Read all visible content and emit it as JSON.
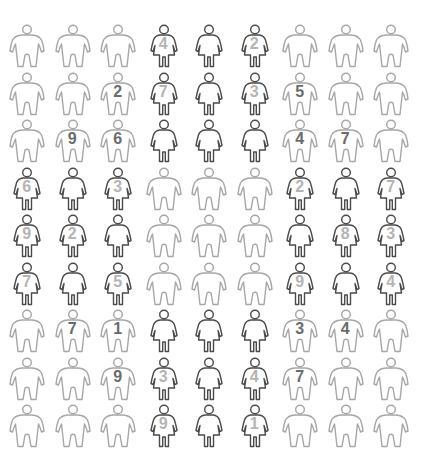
{
  "figure_grid": {
    "rows": 9,
    "columns": 9,
    "colors": {
      "male_outline": "#a6a6a6",
      "female_outline": "#4a4a4a",
      "male_number": "#6b6b6b",
      "female_number": "#b4b4b4",
      "background": "#ffffff"
    },
    "cells": [
      [
        {
          "type": "male",
          "num": ""
        },
        {
          "type": "male",
          "num": ""
        },
        {
          "type": "male",
          "num": ""
        },
        {
          "type": "female",
          "num": "4"
        },
        {
          "type": "female",
          "num": ""
        },
        {
          "type": "female",
          "num": "2"
        },
        {
          "type": "male",
          "num": ""
        },
        {
          "type": "male",
          "num": ""
        },
        {
          "type": "male",
          "num": ""
        }
      ],
      [
        {
          "type": "male",
          "num": ""
        },
        {
          "type": "male",
          "num": ""
        },
        {
          "type": "male",
          "num": "2"
        },
        {
          "type": "female",
          "num": "7"
        },
        {
          "type": "female",
          "num": ""
        },
        {
          "type": "female",
          "num": "3"
        },
        {
          "type": "male",
          "num": "5"
        },
        {
          "type": "male",
          "num": ""
        },
        {
          "type": "male",
          "num": ""
        }
      ],
      [
        {
          "type": "male",
          "num": ""
        },
        {
          "type": "male",
          "num": "9"
        },
        {
          "type": "male",
          "num": "6"
        },
        {
          "type": "female",
          "num": ""
        },
        {
          "type": "female",
          "num": ""
        },
        {
          "type": "female",
          "num": ""
        },
        {
          "type": "male",
          "num": "4"
        },
        {
          "type": "male",
          "num": "7"
        },
        {
          "type": "male",
          "num": ""
        }
      ],
      [
        {
          "type": "female",
          "num": "6"
        },
        {
          "type": "female",
          "num": ""
        },
        {
          "type": "female",
          "num": "3"
        },
        {
          "type": "male",
          "num": ""
        },
        {
          "type": "male",
          "num": ""
        },
        {
          "type": "male",
          "num": ""
        },
        {
          "type": "female",
          "num": "2"
        },
        {
          "type": "female",
          "num": ""
        },
        {
          "type": "female",
          "num": "7"
        }
      ],
      [
        {
          "type": "female",
          "num": "9"
        },
        {
          "type": "female",
          "num": "2"
        },
        {
          "type": "female",
          "num": ""
        },
        {
          "type": "male",
          "num": ""
        },
        {
          "type": "male",
          "num": ""
        },
        {
          "type": "male",
          "num": ""
        },
        {
          "type": "female",
          "num": ""
        },
        {
          "type": "female",
          "num": "8"
        },
        {
          "type": "female",
          "num": "3"
        }
      ],
      [
        {
          "type": "female",
          "num": "7"
        },
        {
          "type": "female",
          "num": ""
        },
        {
          "type": "female",
          "num": "5"
        },
        {
          "type": "male",
          "num": ""
        },
        {
          "type": "male",
          "num": ""
        },
        {
          "type": "male",
          "num": ""
        },
        {
          "type": "female",
          "num": "9"
        },
        {
          "type": "female",
          "num": ""
        },
        {
          "type": "female",
          "num": "4"
        }
      ],
      [
        {
          "type": "male",
          "num": ""
        },
        {
          "type": "male",
          "num": "7"
        },
        {
          "type": "male",
          "num": "1"
        },
        {
          "type": "female",
          "num": ""
        },
        {
          "type": "female",
          "num": ""
        },
        {
          "type": "female",
          "num": ""
        },
        {
          "type": "male",
          "num": "3"
        },
        {
          "type": "male",
          "num": "4"
        },
        {
          "type": "male",
          "num": ""
        }
      ],
      [
        {
          "type": "male",
          "num": ""
        },
        {
          "type": "male",
          "num": ""
        },
        {
          "type": "male",
          "num": "9"
        },
        {
          "type": "female",
          "num": "3"
        },
        {
          "type": "female",
          "num": ""
        },
        {
          "type": "female",
          "num": "4"
        },
        {
          "type": "male",
          "num": "7"
        },
        {
          "type": "male",
          "num": ""
        },
        {
          "type": "male",
          "num": ""
        }
      ],
      [
        {
          "type": "male",
          "num": ""
        },
        {
          "type": "male",
          "num": ""
        },
        {
          "type": "male",
          "num": ""
        },
        {
          "type": "female",
          "num": "9"
        },
        {
          "type": "female",
          "num": ""
        },
        {
          "type": "female",
          "num": "1"
        },
        {
          "type": "male",
          "num": ""
        },
        {
          "type": "male",
          "num": ""
        },
        {
          "type": "male",
          "num": ""
        }
      ]
    ]
  }
}
